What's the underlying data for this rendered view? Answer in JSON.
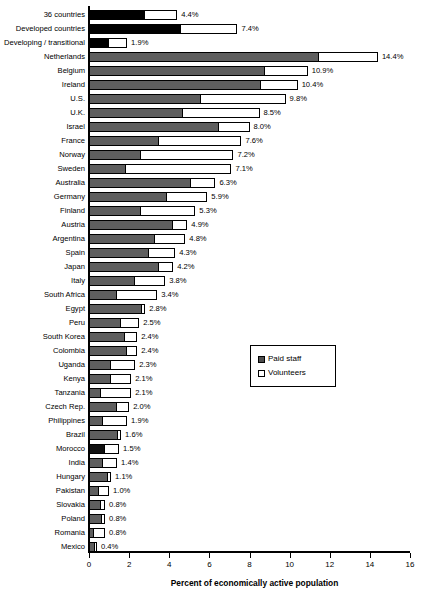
{
  "chart_data": {
    "type": "bar",
    "orientation": "horizontal",
    "stacked": true,
    "title": "",
    "xlabel": "Percent of economically active population",
    "ylabel": "",
    "xlim": [
      0,
      16
    ],
    "xticks": [
      0,
      2,
      4,
      6,
      8,
      10,
      12,
      14,
      16
    ],
    "grid": false,
    "legend_position": "center-right",
    "legend": [
      "Paid staff",
      "Volunteers"
    ],
    "series": [
      {
        "name": "Paid staff",
        "color": "#5e5e5e",
        "values": [
          2.8,
          4.6,
          1.0,
          11.5,
          8.8,
          8.6,
          5.6,
          4.7,
          6.5,
          3.5,
          2.6,
          1.8,
          5.1,
          3.9,
          2.6,
          4.2,
          3.3,
          3.0,
          3.5,
          2.3,
          1.4,
          2.7,
          1.6,
          1.8,
          1.9,
          1.1,
          1.1,
          0.6,
          1.4,
          0.7,
          1.5,
          0.8,
          0.7,
          1.0,
          0.5,
          0.6,
          0.7,
          0.2,
          0.3
        ]
      },
      {
        "name": "Volunteers",
        "color": "#ffffff",
        "values": [
          1.6,
          2.8,
          0.9,
          2.9,
          2.1,
          1.8,
          4.2,
          3.8,
          1.5,
          4.1,
          4.6,
          5.3,
          1.2,
          2.0,
          2.7,
          0.7,
          1.5,
          1.3,
          0.7,
          1.5,
          2.0,
          0.1,
          0.9,
          0.6,
          0.5,
          1.2,
          1.0,
          1.5,
          0.6,
          1.2,
          0.1,
          0.7,
          0.7,
          0.1,
          0.5,
          0.2,
          0.1,
          0.6,
          0.1
        ]
      }
    ],
    "categories": [
      "36 countries",
      "Developed countries",
      "Developing / transitional",
      "Netherlands",
      "Belgium",
      "Ireland",
      "U.S.",
      "U.K.",
      "Israel",
      "France",
      "Norway",
      "Sweden",
      "Australia",
      "Germany",
      "Finland",
      "Austria",
      "Argentina",
      "Spain",
      "Japan",
      "Italy",
      "South Africa",
      "Egypt",
      "Peru",
      "South Korea",
      "Colombia",
      "Uganda",
      "Kenya",
      "Tanzania",
      "Czech Rep.",
      "Philippines",
      "Brazil",
      "Morocco",
      "India",
      "Hungary",
      "Pakistan",
      "Slovakia",
      "Poland",
      "Romania",
      "Mexico"
    ],
    "totals": [
      4.4,
      7.4,
      1.9,
      14.4,
      10.9,
      10.4,
      9.8,
      8.5,
      8.0,
      7.6,
      7.2,
      7.1,
      6.3,
      5.9,
      5.3,
      4.9,
      4.8,
      4.3,
      4.2,
      3.8,
      3.4,
      2.8,
      2.5,
      2.4,
      2.4,
      2.3,
      2.1,
      2.1,
      2.0,
      1.9,
      1.6,
      1.5,
      1.4,
      1.1,
      1.0,
      0.8,
      0.8,
      0.8,
      0.4
    ],
    "value_labels": [
      "4.4%",
      "7.4%",
      "1.9%",
      "14.4%",
      "10.9%",
      "10.4%",
      "9.8%",
      "8.5%",
      "8.0%",
      "7.6%",
      "7.2%",
      "7.1%",
      "6.3%",
      "5.9%",
      "5.3%",
      "4.9%",
      "4.8%",
      "4.3%",
      "4.2%",
      "3.8%",
      "3.4%",
      "2.8%",
      "2.5%",
      "2.4%",
      "2.4%",
      "2.3%",
      "2.1%",
      "2.1%",
      "2.0%",
      "1.9%",
      "1.6%",
      "1.5%",
      "1.4%",
      "1.1%",
      "1.0%",
      "0.8%",
      "0.8%",
      "0.8%",
      "0.4%"
    ],
    "aggregate_rows": [
      0,
      1,
      2
    ],
    "dark_rows": [
      31
    ]
  },
  "axis": {
    "tick_labels": [
      "0",
      "2",
      "4",
      "6",
      "8",
      "10",
      "12",
      "14",
      "16"
    ],
    "title": "Percent of economically active population"
  },
  "legend": {
    "items": [
      {
        "label": "Paid staff",
        "swatch": "filled-square-icon"
      },
      {
        "label": "Volunteers",
        "swatch": "empty-square-icon"
      }
    ]
  }
}
